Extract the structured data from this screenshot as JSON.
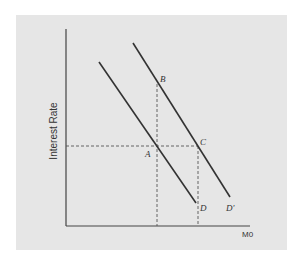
{
  "diagram": {
    "type": "money-demand-shift",
    "axes": {
      "y_label": "Interest Rate",
      "x_label": "M0"
    },
    "curves": [
      {
        "name": "D",
        "label": "D"
      },
      {
        "name": "D-prime",
        "label": "D'"
      }
    ],
    "points": [
      {
        "name": "A",
        "label": "A"
      },
      {
        "name": "B",
        "label": "B"
      },
      {
        "name": "C",
        "label": "C"
      }
    ],
    "colors": {
      "panel": "#e6e6e6",
      "line": "#333333",
      "dashed": "#555555"
    }
  }
}
